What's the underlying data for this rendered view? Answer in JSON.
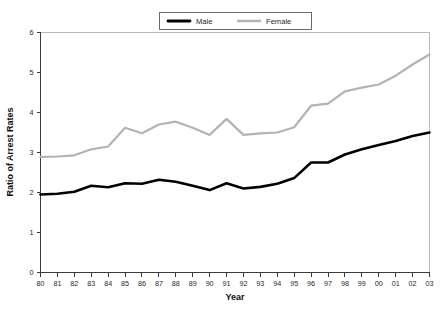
{
  "chart_data": {
    "type": "line",
    "title": "",
    "xlabel": "Year",
    "ylabel": "Ratio of Arrest Rates",
    "categories": [
      "80",
      "81",
      "82",
      "83",
      "84",
      "85",
      "86",
      "87",
      "88",
      "89",
      "90",
      "91",
      "92",
      "93",
      "94",
      "95",
      "96",
      "97",
      "98",
      "99",
      "00",
      "01",
      "02",
      "03"
    ],
    "xlim": [
      0,
      23
    ],
    "ylim": [
      0,
      6
    ],
    "yticks": [
      0,
      1,
      2,
      3,
      4,
      5,
      6
    ],
    "ytick_labels": [
      "0",
      "1",
      "2",
      "3",
      "4",
      "5",
      "6"
    ],
    "grid": false,
    "legend_position": "top-center",
    "series": [
      {
        "name": "Male",
        "color": "#000000",
        "width": 2.6,
        "values": [
          1.95,
          1.97,
          2.02,
          2.17,
          2.13,
          2.23,
          2.22,
          2.32,
          2.27,
          2.17,
          2.06,
          2.23,
          2.1,
          2.14,
          2.22,
          2.36,
          2.75,
          2.75,
          2.95,
          3.08,
          3.19,
          3.29,
          3.41,
          3.5
        ]
      },
      {
        "name": "Female",
        "color": "#b3b3b3",
        "width": 2.2,
        "values": [
          2.89,
          2.9,
          2.93,
          3.08,
          3.15,
          3.62,
          3.48,
          3.7,
          3.77,
          3.62,
          3.44,
          3.84,
          3.44,
          3.48,
          3.5,
          3.63,
          4.17,
          4.22,
          4.53,
          4.62,
          4.7,
          4.92,
          5.2,
          5.45
        ]
      }
    ]
  },
  "legend": {
    "items": [
      {
        "label": "Male"
      },
      {
        "label": "Female"
      }
    ]
  },
  "axes": {
    "x_title": "Year",
    "y_title": "Ratio of Arrest Rates"
  }
}
